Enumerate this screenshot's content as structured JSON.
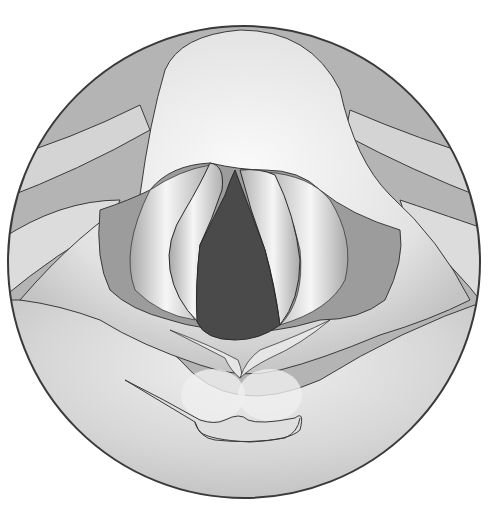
{
  "figure": {
    "colors": {
      "background": "#ffffff",
      "outline": "#3a3a3a",
      "outer_tissue": "#b4b4b4",
      "light_tissue": "#ececec",
      "mid_tissue": "#c8c8c8",
      "ventricle": "#9a9a9a",
      "glottis": "#4a4a4a"
    },
    "parts": [
      "epiglottis",
      "aryepiglottic-fold-left",
      "aryepiglottic-fold-right",
      "vestibular-fold-left",
      "vestibular-fold-right",
      "vocal-fold-left",
      "vocal-fold-right",
      "glottis",
      "arytenoid-region",
      "interarytenoid-notch",
      "posterior-pharyngeal-wall"
    ]
  }
}
